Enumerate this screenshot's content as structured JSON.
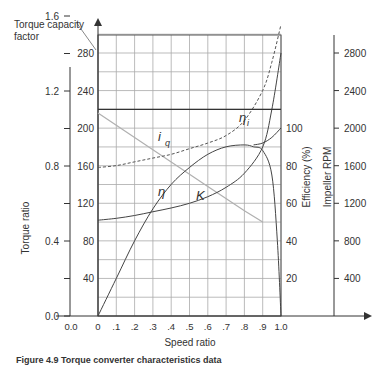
{
  "chart_data": {
    "type": "line",
    "title": "",
    "xlabel": "Speed ratio",
    "x_ticks": [
      "0",
      ".1",
      ".2",
      ".3",
      ".4",
      ".5",
      ".6",
      ".7",
      ".8",
      ".9",
      "1.0"
    ],
    "x_extra_tick": "0.0",
    "xlim": [
      0,
      1.0
    ],
    "grid": true,
    "axes": {
      "torque_capacity_factor": {
        "label": "Torque capacity factor",
        "ticks": [
          40,
          80,
          120,
          160,
          200,
          240,
          280
        ],
        "range": [
          0,
          300
        ]
      },
      "torque_ratio": {
        "label": "Torque ratio",
        "ticks": [
          "0.0",
          "0.4",
          "0.8",
          "1.2",
          "1.6",
          "2.0",
          "2.2"
        ],
        "range": [
          0,
          2.6
        ]
      },
      "efficiency": {
        "label": "Efficiency (%)",
        "ticks": [
          20,
          40,
          60,
          80,
          100
        ],
        "range": [
          0,
          100
        ]
      },
      "impeller_rpm": {
        "label": "Impeller RPM",
        "ticks": [
          400,
          800,
          1200,
          1600,
          2000,
          2400,
          2800
        ],
        "range": [
          0,
          2900
        ]
      }
    },
    "series": [
      {
        "name": "i_q",
        "label": "i_q",
        "axis": "torque_capacity_factor",
        "style": "gray-solid",
        "x": [
          0,
          0.2,
          0.4,
          0.6,
          0.8,
          0.9
        ],
        "values": [
          216,
          190,
          164,
          138,
          112,
          100
        ]
      },
      {
        "name": "eta",
        "label": "η",
        "axis": "efficiency",
        "style": "solid",
        "x": [
          0,
          0.1,
          0.2,
          0.3,
          0.4,
          0.5,
          0.6,
          0.7,
          0.8,
          0.85,
          0.9,
          0.95,
          0.98,
          1.0
        ],
        "values": [
          0,
          20,
          40,
          57,
          70,
          79,
          86,
          90,
          91,
          90,
          88,
          75,
          40,
          0
        ]
      },
      {
        "name": "K",
        "label": "K",
        "axis": "impeller_rpm",
        "style": "solid",
        "x": [
          0,
          0.1,
          0.2,
          0.3,
          0.4,
          0.5,
          0.6,
          0.7,
          0.8,
          0.9,
          0.95,
          1.0
        ],
        "values": [
          1020,
          1040,
          1070,
          1110,
          1150,
          1200,
          1270,
          1370,
          1520,
          1800,
          2200,
          2800
        ]
      },
      {
        "name": "eta_i",
        "label": "η_i",
        "axis": "efficiency",
        "style": "dashed",
        "x": [
          0,
          0.1,
          0.2,
          0.3,
          0.4,
          0.5,
          0.6,
          0.7,
          0.8,
          0.9,
          0.95,
          1.0
        ],
        "values": [
          79,
          80,
          82,
          84,
          86,
          89,
          92,
          96,
          104,
          120,
          135,
          155
        ]
      },
      {
        "name": "eta_hline",
        "label": "",
        "axis": "torque_capacity_factor",
        "style": "solid-dark",
        "x": [
          0,
          1.0
        ],
        "values": [
          220,
          220
        ]
      },
      {
        "name": "eta_right",
        "label": "",
        "axis": "efficiency",
        "style": "solid",
        "x": [
          0.85,
          0.9,
          0.95,
          1.0
        ],
        "values": [
          91,
          92,
          95,
          100
        ]
      }
    ],
    "annotations": [
      "i_q",
      "η_i",
      "η",
      "K"
    ]
  },
  "labels": {
    "tcf_title_line1": "Torque capacity",
    "tcf_title_line2": "factor",
    "torque_ratio": "Torque ratio",
    "efficiency": "Efficiency (%)",
    "rpm": "Impeller RPM",
    "speed_ratio": "Speed ratio",
    "curve_iq_main": "i",
    "curve_iq_sub": "q",
    "curve_etai_main": "η",
    "curve_etai_sub": "i",
    "curve_eta": "η",
    "curve_K": "K"
  },
  "caption": "Figure 4.9  Torque converter characteristics data"
}
